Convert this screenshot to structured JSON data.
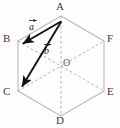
{
  "figure": {
    "width": 120,
    "height": 128,
    "background_color": "#fefefe",
    "solid_edge_color": "#b9b9b9",
    "dashed_line_color": "#a8a8a8",
    "vector_color": "#111111",
    "label_color": "#3a3a3a"
  },
  "vertices": [
    {
      "id": "A",
      "label": "A",
      "x": 61,
      "y": 16,
      "label_x": 58,
      "label_y": 2
    },
    {
      "id": "B",
      "label": "B",
      "x": 18,
      "y": 41,
      "label_x": 4,
      "label_y": 35
    },
    {
      "id": "C",
      "label": "C",
      "x": 18,
      "y": 91,
      "label_x": 4,
      "label_y": 88
    },
    {
      "id": "D",
      "label": "D",
      "x": 61,
      "y": 116,
      "label_x": 57,
      "label_y": 116
    },
    {
      "id": "E",
      "label": "E",
      "x": 104,
      "y": 91,
      "label_x": 107,
      "label_y": 88
    },
    {
      "id": "F",
      "label": "F",
      "x": 104,
      "y": 41,
      "label_x": 107,
      "label_y": 35
    }
  ],
  "center": {
    "id": "O",
    "label": "O",
    "x": 61,
    "y": 66,
    "label_x": 62,
    "label_y": 58
  },
  "edges": [
    {
      "from": "A",
      "to": "B",
      "style": "solid"
    },
    {
      "from": "B",
      "to": "C",
      "style": "solid"
    },
    {
      "from": "C",
      "to": "D",
      "style": "solid"
    },
    {
      "from": "D",
      "to": "E",
      "style": "solid"
    },
    {
      "from": "E",
      "to": "F",
      "style": "solid"
    },
    {
      "from": "F",
      "to": "A",
      "style": "solid"
    }
  ],
  "diagonals": [
    {
      "from": "A",
      "to": "D",
      "style": "dashed"
    },
    {
      "from": "B",
      "to": "E",
      "style": "dashed"
    },
    {
      "from": "C",
      "to": "F",
      "style": "dashed"
    }
  ],
  "vectors": [
    {
      "id": "a",
      "label": "a",
      "from": "A",
      "to": "B",
      "x1": 60,
      "y1": 22,
      "x2": 22,
      "y2": 44,
      "label_x": 30,
      "label_y": 22
    },
    {
      "id": "b",
      "label": "b",
      "from": "A",
      "to": "C",
      "x1": 61,
      "y1": 22,
      "x2": 21,
      "y2": 88,
      "label_x": 45,
      "label_y": 46
    }
  ]
}
